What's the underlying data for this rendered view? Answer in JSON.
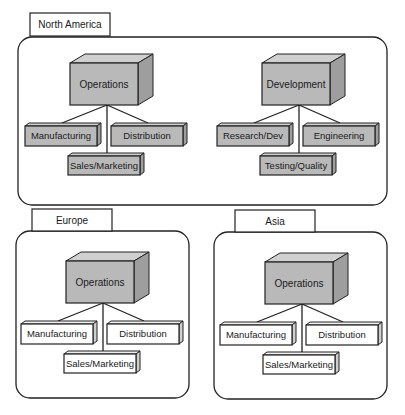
{
  "diagram": {
    "colors": {
      "filled_front": "#b9b9b9",
      "filled_top": "#d0d0d0",
      "filled_side": "#9e9e9e",
      "white_front": "#ffffff",
      "white_top": "#f0f0f0",
      "white_side": "#cfcfcf",
      "stroke": "#222222"
    },
    "regions": [
      {
        "name": "North America",
        "units": [
          {
            "head": "Operations",
            "children": [
              "Manufacturing",
              "Distribution",
              "Sales/Marketing"
            ],
            "style": "filled"
          },
          {
            "head": "Development",
            "children": [
              "Research/Dev",
              "Engineering",
              "Testing/Quality"
            ],
            "style": "filled"
          }
        ]
      },
      {
        "name": "Europe",
        "units": [
          {
            "head": "Operations",
            "children": [
              "Manufacturing",
              "Distribution",
              "Sales/Marketing"
            ],
            "style": "white-children"
          }
        ]
      },
      {
        "name": "Asia",
        "units": [
          {
            "head": "Operations",
            "children": [
              "Manufacturing",
              "Distribution",
              "Sales/Marketing"
            ],
            "style": "white-children"
          }
        ]
      }
    ]
  }
}
